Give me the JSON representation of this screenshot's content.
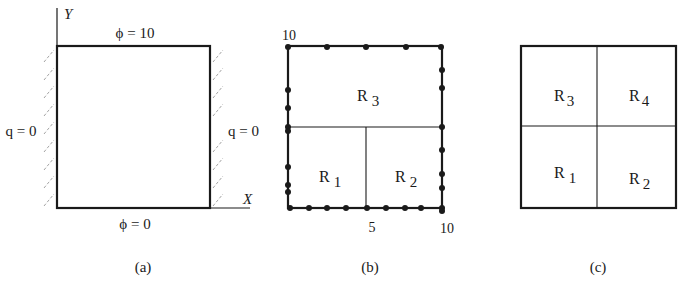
{
  "figure": {
    "colors": {
      "ink": "#1a1a1a",
      "hatch": "#9a9a9a",
      "background": "#ffffff"
    },
    "panels": [
      {
        "id": "a",
        "caption": "(a)",
        "axes": {
          "x_label": "X",
          "y_label": "Y"
        },
        "boundary_conditions": {
          "top": "ϕ = 10",
          "bottom": "ϕ = 0",
          "left": "q = 0",
          "right": "q = 0"
        }
      },
      {
        "id": "b",
        "caption": "(b)",
        "tick_labels": {
          "top_left": "10",
          "bottom_mid": "5",
          "bottom_right": "10"
        },
        "regions": [
          {
            "name": "R",
            "sub": "3"
          },
          {
            "name": "R",
            "sub": "1"
          },
          {
            "name": "R",
            "sub": "2"
          }
        ],
        "boundary_nodes": {
          "top": 5,
          "bottom": 9,
          "left": 9,
          "right": 8
        }
      },
      {
        "id": "c",
        "caption": "(c)",
        "regions": [
          {
            "name": "R",
            "sub": "3"
          },
          {
            "name": "R",
            "sub": "4"
          },
          {
            "name": "R",
            "sub": "1"
          },
          {
            "name": "R",
            "sub": "2"
          }
        ]
      }
    ]
  }
}
